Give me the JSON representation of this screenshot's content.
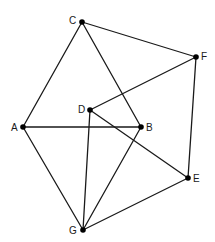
{
  "diagram": {
    "type": "graph",
    "nodes": [
      {
        "id": "A",
        "label": "A",
        "x": 23,
        "y": 127,
        "lx": 11,
        "ly": 131
      },
      {
        "id": "B",
        "label": "B",
        "x": 141,
        "y": 127,
        "lx": 146,
        "ly": 131
      },
      {
        "id": "C",
        "label": "C",
        "x": 82,
        "y": 22,
        "lx": 69,
        "ly": 24
      },
      {
        "id": "D",
        "label": "D",
        "x": 90,
        "y": 110,
        "lx": 78,
        "ly": 113
      },
      {
        "id": "E",
        "label": "E",
        "x": 188,
        "y": 178,
        "lx": 193,
        "ly": 182
      },
      {
        "id": "F",
        "label": "F",
        "x": 196,
        "y": 57,
        "lx": 201,
        "ly": 60
      },
      {
        "id": "G",
        "label": "G",
        "x": 83,
        "y": 230,
        "lx": 69,
        "ly": 234
      }
    ],
    "edges": [
      [
        "C",
        "A"
      ],
      [
        "C",
        "B"
      ],
      [
        "C",
        "F"
      ],
      [
        "F",
        "D"
      ],
      [
        "F",
        "E"
      ],
      [
        "D",
        "E"
      ],
      [
        "D",
        "G"
      ],
      [
        "A",
        "B"
      ],
      [
        "A",
        "G"
      ],
      [
        "B",
        "G"
      ],
      [
        "E",
        "G"
      ]
    ]
  }
}
